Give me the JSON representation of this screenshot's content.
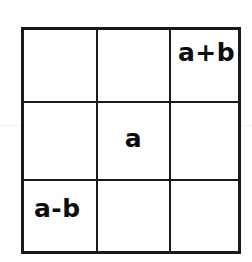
{
  "figure": {
    "name": "3x3 grid with algebraic entries",
    "background_color": "#ffffff",
    "line_color": "#1a1a1a",
    "text_color": "#0d0d0d",
    "rows": 3,
    "columns": 3,
    "cells": [
      [
        {
          "text": "",
          "filled": false
        },
        {
          "text": "",
          "filled": false
        },
        {
          "text": "a+b",
          "filled": true
        }
      ],
      [
        {
          "text": "",
          "filled": false
        },
        {
          "text": "a",
          "filled": true
        },
        {
          "text": "",
          "filled": false
        }
      ],
      [
        {
          "text": "a-b",
          "filled": true
        },
        {
          "text": "",
          "filled": false
        },
        {
          "text": "",
          "filled": false
        }
      ]
    ]
  }
}
